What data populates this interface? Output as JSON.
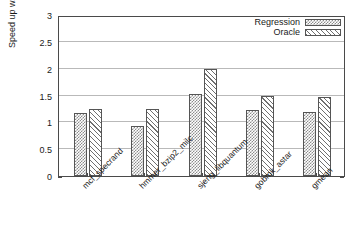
{
  "chart_data": {
    "type": "bar",
    "title": "",
    "xlabel": "",
    "ylabel": "Speed up w.r.t x86",
    "ylim": [
      0,
      3
    ],
    "ytick_labels": [
      "0",
      "0.5",
      "1",
      "1.5",
      "2",
      "2.5",
      "3"
    ],
    "ytick_values": [
      0,
      0.5,
      1,
      1.5,
      2,
      2.5,
      3
    ],
    "grid": true,
    "legend_position": "top-right",
    "categories": [
      "mcf_specrand",
      "hmmer_bzip2_milc",
      "sjeng_libquantum",
      "gobmk_astar",
      "gmean"
    ],
    "series": [
      {
        "name": "Regression",
        "pattern": "crosshatch",
        "values": [
          1.18,
          0.94,
          1.52,
          1.23,
          1.19
        ]
      },
      {
        "name": "Oracle",
        "pattern": "diagonal-hatch",
        "values": [
          1.25,
          1.24,
          2.0,
          1.49,
          1.48
        ]
      }
    ]
  },
  "legend": {
    "items": [
      {
        "label": "Regression",
        "swatch": "crosshatch-swatch"
      },
      {
        "label": "Oracle",
        "swatch": "diagonal-hatch-swatch"
      }
    ]
  },
  "colors": {
    "frame": "#4a4a4a",
    "gridline": "#b9b9b9",
    "bar_outline": "#555555",
    "hatch": "#6f6f6f",
    "background": "#ffffff"
  }
}
